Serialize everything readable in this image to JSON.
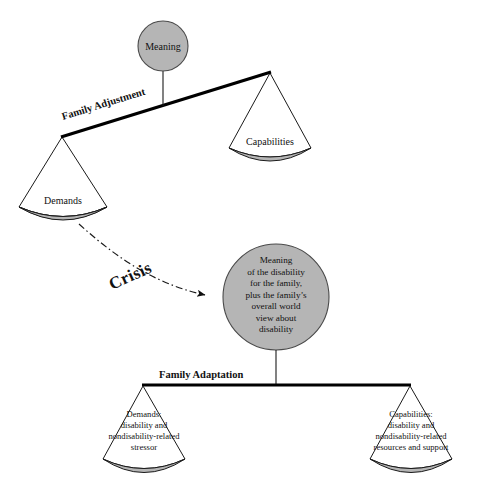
{
  "diagram": {
    "type": "double-beam-balance-scale-concept-diagram",
    "background_color": "#ffffff",
    "ink_color": "#111111",
    "fill_gray": "#b5b5b5",
    "upper_scale": {
      "name": "Family Adjustment",
      "beam_label": "Family Adjustment",
      "beam_tilt": "left side down, right side up",
      "fulcrum_node": {
        "label": "Meaning",
        "shape": "circle",
        "fill": "#b5b5b5"
      },
      "left_pan": {
        "label": "Demands",
        "state": "down"
      },
      "right_pan": {
        "label": "Capabilities",
        "state": "up"
      }
    },
    "transition": {
      "label": "Crisis",
      "arrow_style": "dash-dot curved arrow",
      "from": "Demands pan",
      "to": "Meaning of the disability circle"
    },
    "center_node": {
      "shape": "circle",
      "fill": "#b5b5b5",
      "lines": [
        "Meaning",
        "of the disability",
        "for the family,",
        "plus the family’s",
        "overall world",
        "view about",
        "disability"
      ]
    },
    "lower_scale": {
      "name": "Family Adaptation",
      "beam_label": "Family Adaptation",
      "beam_tilt": "level / balanced",
      "left_pan": {
        "lines": [
          "Demands:",
          "disability and",
          "nondisability-related",
          "stressor"
        ]
      },
      "right_pan": {
        "lines": [
          "Capabilities:",
          "disability and",
          "nondisability-related",
          "resources and support"
        ]
      }
    }
  }
}
